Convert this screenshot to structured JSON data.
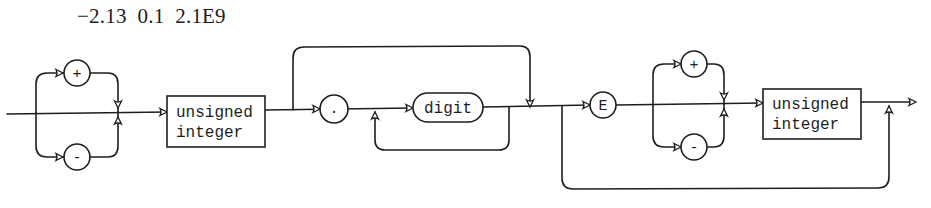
{
  "header": {
    "examples": "−2.13  0.1  2.1E9"
  },
  "diagram": {
    "type": "syntax-diagram",
    "sign_1": {
      "plus": "+",
      "minus": "-"
    },
    "integer_part": {
      "line1": "unsigned",
      "line2": "integer"
    },
    "fraction": {
      "point": ".",
      "digit": "digit"
    },
    "exponent": {
      "marker": "E",
      "sign": {
        "plus": "+",
        "minus": "-"
      },
      "integer": {
        "line1": "unsigned",
        "line2": "integer"
      }
    },
    "colors": {
      "ink": "#1e1e1e",
      "background": "#ffffff"
    }
  }
}
